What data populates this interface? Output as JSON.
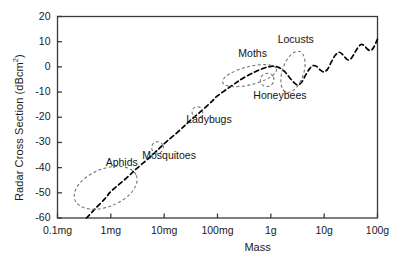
{
  "chart_data": {
    "type": "line",
    "title": "",
    "xlabel": "Mass",
    "ylabel": "Radar Cross Section (dBcm2)",
    "ylabel_display": "Radar Cross Section (dBcm²)",
    "x_scale": "log",
    "xtick_labels": [
      "0.1mg",
      "1mg",
      "10mg",
      "100mg",
      "1g",
      "10g",
      "100g"
    ],
    "xtick_values": [
      0.0001,
      0.001,
      0.01,
      0.1,
      1,
      10,
      100
    ],
    "x_unit": "g",
    "ytick_labels": [
      "20",
      "10",
      "0",
      "-10",
      "-20",
      "-30",
      "-40",
      "-50",
      "-60"
    ],
    "ytick_values": [
      20,
      10,
      0,
      -10,
      -20,
      -30,
      -40,
      -50,
      -60
    ],
    "ylim": [
      -60,
      20
    ],
    "xlim": [
      0.0001,
      100
    ],
    "grid": false,
    "legend": false,
    "line_style": "dashed",
    "line_color": "#000000",
    "series": [
      {
        "name": "Radar cross section vs mass",
        "points": [
          [
            0.00035,
            -60.0
          ],
          [
            0.0005,
            -56.5
          ],
          [
            0.0008,
            -52.0
          ],
          [
            0.001,
            -49.5
          ],
          [
            0.002,
            -44.0
          ],
          [
            0.003,
            -40.5
          ],
          [
            0.005,
            -36.5
          ],
          [
            0.008,
            -32.5
          ],
          [
            0.01,
            -30.5
          ],
          [
            0.02,
            -25.0
          ],
          [
            0.03,
            -21.5
          ],
          [
            0.05,
            -17.5
          ],
          [
            0.08,
            -13.5
          ],
          [
            0.1,
            -11.5
          ],
          [
            0.2,
            -7.0
          ],
          [
            0.3,
            -4.5
          ],
          [
            0.5,
            -2.0
          ],
          [
            0.7,
            -0.7
          ],
          [
            0.9,
            0.0
          ],
          [
            1.1,
            0.3
          ],
          [
            1.4,
            -0.2
          ],
          [
            1.8,
            -1.8
          ],
          [
            2.2,
            -4.0
          ],
          [
            2.7,
            -6.2
          ],
          [
            3.2,
            -7.2
          ],
          [
            3.8,
            -6.0
          ],
          [
            4.5,
            -3.2
          ],
          [
            5.3,
            -0.8
          ],
          [
            6.2,
            0.5
          ],
          [
            7.2,
            0.2
          ],
          [
            8.4,
            -1.2
          ],
          [
            9.8,
            -2.0
          ],
          [
            11.5,
            -1.0
          ],
          [
            13.5,
            1.8
          ],
          [
            16.0,
            4.5
          ],
          [
            19.0,
            5.8
          ],
          [
            22.0,
            5.0
          ],
          [
            26.0,
            3.2
          ],
          [
            30.0,
            2.8
          ],
          [
            35.0,
            4.5
          ],
          [
            41.0,
            7.0
          ],
          [
            48.0,
            8.8
          ],
          [
            56.0,
            8.5
          ],
          [
            65.0,
            7.0
          ],
          [
            75.0,
            6.5
          ],
          [
            86.0,
            8.0
          ],
          [
            100.0,
            11.0
          ]
        ]
      }
    ],
    "annotations": [
      {
        "label": "Aphids",
        "x": 0.0008,
        "y": -48.0,
        "ellipse": {
          "rx_dec": 0.62,
          "ry_db": 7.5,
          "rotation": -22
        },
        "label_dx_dec": 0.3,
        "label_dy_db": 10.0
      },
      {
        "label": "Mosquitoes",
        "x": 0.0075,
        "y": -32.0,
        "ellipse": {
          "rx_dec": 0.11,
          "ry_db": 2.3,
          "rotation": -20
        },
        "label_dx_dec": 0.22,
        "label_dy_db": -3.5
      },
      {
        "label": "Ladybugs",
        "x": 0.042,
        "y": -18.0,
        "ellipse": {
          "rx_dec": 0.1,
          "ry_db": 2.2,
          "rotation": -20
        },
        "label_dx_dec": 0.22,
        "label_dy_db": -3.2
      },
      {
        "label": "Moths",
        "x": 0.4,
        "y": -3.5,
        "ellipse": {
          "rx_dec": 0.52,
          "ry_db": 3.6,
          "rotation": -14
        },
        "label_dx_dec": 0.06,
        "label_dy_db": 8.5
      },
      {
        "label": "Honeybees",
        "x": 0.85,
        "y": -5.2,
        "ellipse": {
          "rx_dec": 0.13,
          "ry_db": 2.6,
          "rotation": -25
        },
        "label_dx_dec": 0.24,
        "label_dy_db": -6.5
      },
      {
        "label": "Locusts",
        "x": 2.6,
        "y": -2.0,
        "ellipse": {
          "rx_dec": 0.2,
          "ry_db": 8.5,
          "rotation": 18
        },
        "label_dx_dec": 0.05,
        "label_dy_db": 12.5
      }
    ]
  },
  "figure": {
    "background_color": "#ffffff",
    "axis_color": "#3a3a3a",
    "text_color": "#1a1a1a",
    "annotation_color": "#6e6e6e"
  }
}
